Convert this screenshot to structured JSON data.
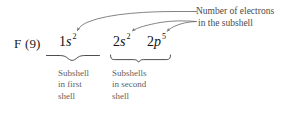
{
  "figure": {
    "element": {
      "symbol_and_number": "F (9)"
    },
    "configuration": [
      {
        "id": "1s",
        "principal": "1",
        "orbital": "s",
        "electrons": "2"
      },
      {
        "id": "2s",
        "principal": "2",
        "orbital": "s",
        "electrons": "2"
      },
      {
        "id": "2p",
        "principal": "2",
        "orbital": "p",
        "electrons": "5"
      }
    ],
    "annotation": {
      "line1": "Number of electrons",
      "line2": "in the subshell"
    },
    "captions": [
      {
        "id": "first-shell",
        "line1": "Subshell",
        "line2": "in first",
        "line3": "shell"
      },
      {
        "id": "second-shell",
        "line1": "Subshells",
        "line2": "in second",
        "line3": "shell"
      }
    ],
    "colors": {
      "text": "#111111",
      "caption_text": "#5f5f5f",
      "annotation_text": "#4a4a4a",
      "rule": "#6e6e6e",
      "background": "#ffffff"
    }
  }
}
